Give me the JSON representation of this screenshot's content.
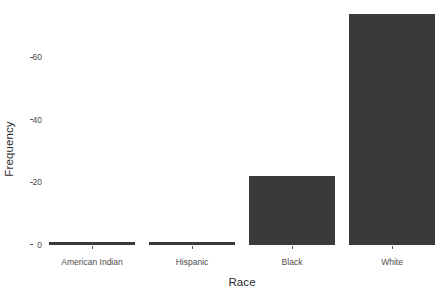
{
  "chart_data": {
    "type": "bar",
    "title": "",
    "subtitle": "",
    "xlabel": "Race",
    "ylabel": "Frequency",
    "categories": [
      "American Indian",
      "Hispanic",
      "Black",
      "White"
    ],
    "values": [
      1,
      1,
      22,
      74
    ],
    "ylim": [
      0,
      76
    ],
    "yticks": [
      0,
      20,
      40,
      60
    ],
    "ytick_labels": [
      "0",
      "20",
      "40",
      "60"
    ],
    "grid": false,
    "legend": null,
    "series": [
      {
        "name": "Frequency",
        "values": [
          1,
          1,
          22,
          74
        ]
      }
    ],
    "colors": {
      "bar_fill": "#3a3a3a",
      "background": "#ffffff",
      "axis_text": "#4d4d4d",
      "axis_title": "#2b2b2b",
      "tick_mark": "#5a5a5a"
    }
  }
}
